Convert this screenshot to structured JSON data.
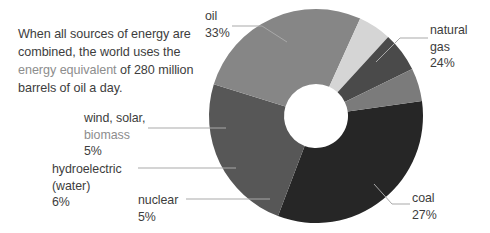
{
  "intro": {
    "line_a": "When all sources of energy are combined, the world uses the ",
    "highlight": "energy equivalent",
    "line_b": " of 280 million barrels of oil a day."
  },
  "labels": {
    "oil": {
      "name": "oil",
      "value": "33%"
    },
    "gas": {
      "name": "natural",
      "name2": "gas",
      "value": "24%"
    },
    "coal": {
      "name": "coal",
      "value": "27%"
    },
    "nuclear": {
      "name": "nuclear",
      "value": "5%"
    },
    "hydro": {
      "name": "hydroelectric",
      "name2": "(water)",
      "value": "6%"
    },
    "wind": {
      "name": "wind, solar,",
      "name2": "biomass",
      "value": "5%"
    }
  },
  "chart_data": {
    "type": "pie",
    "variant": "donut",
    "units": "percent of total energy consumption",
    "total_label": "280 million barrels of oil equivalent a day",
    "legend": "none",
    "labels": [
      "oil",
      "natural gas",
      "coal",
      "nuclear",
      "hydroelectric (water)",
      "wind, solar, biomass"
    ],
    "values": [
      33,
      24,
      27,
      5,
      6,
      5
    ],
    "colors": [
      "#262626",
      "#575757",
      "#868686",
      "#d5d5d5",
      "#4a4a4a",
      "#7b7b7b"
    ],
    "start_angle_deg": -8,
    "geometry": {
      "cx": 316,
      "cy": 116,
      "outer_r": 107,
      "inner_r": 32
    }
  }
}
